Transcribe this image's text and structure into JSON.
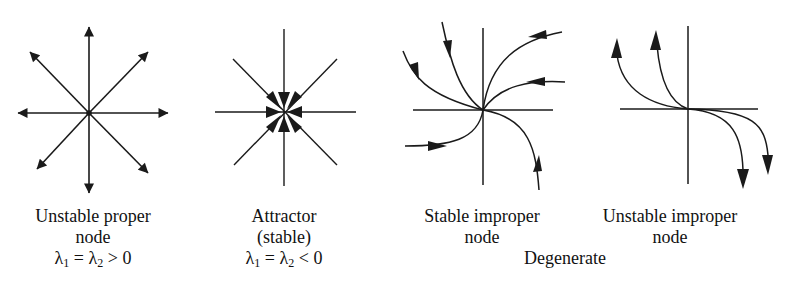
{
  "figure": {
    "colors": {
      "line": "#1a1a1a",
      "background": "#ffffff"
    },
    "panels": [
      {
        "id": "unstable-proper-node",
        "caption_lines": [
          "Unstable proper",
          "node"
        ],
        "condition": {
          "lhs": "λ",
          "sub1": "1",
          "eq": " = λ",
          "sub2": "2",
          "rel": " > 0"
        },
        "description": "8 straight trajectories radiating outward from origin, arrows pointing away"
      },
      {
        "id": "attractor-stable",
        "caption_lines": [
          "Attractor",
          "(stable)"
        ],
        "condition": {
          "lhs": "λ",
          "sub1": "1",
          "eq": " = λ",
          "sub2": "2",
          "rel": " < 0"
        },
        "description": "8 straight trajectories converging to origin, arrowheads pointing inward at center"
      },
      {
        "id": "stable-improper-node",
        "caption_lines": [
          "Stable improper",
          "node"
        ],
        "description": "curved trajectories approaching origin tangentially, arrows pointing toward origin"
      },
      {
        "id": "unstable-improper-node",
        "caption_lines": [
          "Unstable improper",
          "node"
        ],
        "description": "curved trajectories leaving origin tangentially to horizontal axis, arrows pointing away"
      }
    ],
    "group_label": "Degenerate"
  }
}
